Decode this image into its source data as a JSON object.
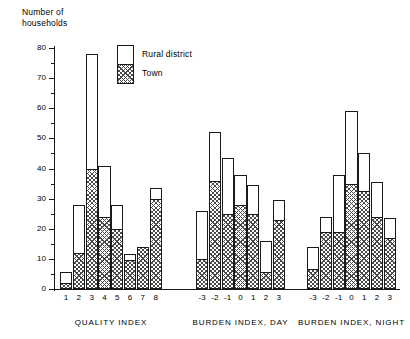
{
  "chart_data": {
    "type": "bar",
    "title": "",
    "subtitle": "",
    "ylabel": "Number of\nhouseholds",
    "xlabel": "",
    "ylim": [
      0,
      80
    ],
    "ytick_step": 10,
    "yminor_step": 5,
    "yticks": [
      0,
      10,
      20,
      30,
      40,
      50,
      60,
      70,
      80
    ],
    "grid": false,
    "stacked": true,
    "legend_position": "top-center",
    "legend": [
      {
        "name": "Rural district",
        "fill": "white"
      },
      {
        "name": "Town",
        "fill": "hatched"
      }
    ],
    "series": [
      {
        "name": "Town"
      },
      {
        "name": "Rural district"
      }
    ],
    "groups": [
      {
        "label": "QUALITY INDEX",
        "categories": [
          "1",
          "2",
          "3",
          "4",
          "5",
          "6",
          "7",
          "8"
        ],
        "town": [
          2,
          12,
          40,
          24,
          20,
          9.5,
          14,
          30
        ],
        "total": [
          5.5,
          28,
          78,
          41,
          28,
          11.5,
          14,
          33.5
        ]
      },
      {
        "label": "BURDEN INDEX, DAY",
        "categories": [
          "-3",
          "-2",
          "-1",
          "0",
          "1",
          "2",
          "3"
        ],
        "town": [
          10,
          36,
          25,
          28,
          25,
          5.5,
          23
        ],
        "total": [
          26,
          52,
          43.5,
          38,
          34.5,
          16,
          29.5
        ]
      },
      {
        "label": "BURDEN INDEX, NIGHT",
        "categories": [
          "-3",
          "-2",
          "-1",
          "0",
          "1",
          "2",
          "3"
        ],
        "town": [
          6.5,
          19,
          19,
          35,
          32.5,
          24,
          17
        ],
        "total": [
          14,
          24,
          38,
          59,
          45,
          35.5,
          23.5
        ]
      }
    ]
  },
  "colors": {
    "ink": "#1a1a1a",
    "hatch": "#4a4a4a",
    "background": "#ffffff"
  }
}
